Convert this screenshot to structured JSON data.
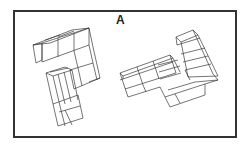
{
  "figure": {
    "label": "A",
    "colors": {
      "frame": "#333333",
      "lines": "#3a3a3a",
      "background": "#ffffff"
    },
    "objects": [
      {
        "name": "left-cube-figure",
        "position": "left"
      },
      {
        "name": "right-cube-figure",
        "position": "right"
      }
    ]
  }
}
